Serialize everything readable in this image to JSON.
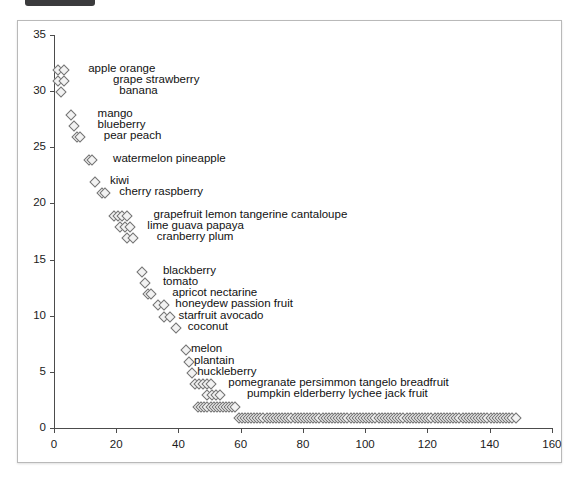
{
  "window": {
    "tab_fragment": ""
  },
  "chart_data": {
    "type": "scatter",
    "title": "",
    "subtitle": "",
    "xlabel": "",
    "ylabel": "",
    "xlim": [
      -4,
      168
    ],
    "ylim": [
      -0.8,
      36.2
    ],
    "grid": false,
    "legend": null,
    "xticks": [
      0,
      20,
      40,
      60,
      80,
      100,
      120,
      140,
      160
    ],
    "yticks": [
      0,
      5,
      10,
      15,
      20,
      25,
      30,
      35
    ],
    "xtick_labels": [
      "0",
      "20",
      "40",
      "60",
      "80",
      "100",
      "120",
      "140",
      "160"
    ],
    "ytick_labels": [
      "0",
      "5",
      "10",
      "15",
      "20",
      "25",
      "30",
      "35"
    ],
    "marker": "diamond",
    "marker_color": "#f2f2f2",
    "marker_edge_color": "#737373",
    "rows": [
      {
        "y": 32,
        "x_start": 1,
        "x_end": 3,
        "count": 2,
        "label": "apple  orange",
        "label_x": 11
      },
      {
        "y": 31,
        "x_start": 1,
        "x_end": 3,
        "count": 2,
        "label": "grape  strawberry",
        "label_x": 19
      },
      {
        "y": 30,
        "x_start": 2,
        "x_end": 2,
        "count": 1,
        "label": "banana",
        "label_x": 21
      },
      {
        "y": 28,
        "x_start": 5,
        "x_end": 5,
        "count": 1,
        "label": "mango",
        "label_x": 14
      },
      {
        "y": 27,
        "x_start": 6,
        "x_end": 6,
        "count": 1,
        "label": "blueberry",
        "label_x": 14
      },
      {
        "y": 26,
        "x_start": 7,
        "x_end": 8,
        "count": 2,
        "label": "pear  peach",
        "label_x": 16
      },
      {
        "y": 24,
        "x_start": 11,
        "x_end": 12,
        "count": 2,
        "label": "watermelon  pineapple",
        "label_x": 19
      },
      {
        "y": 22,
        "x_start": 13,
        "x_end": 13,
        "count": 1,
        "label": "kiwi",
        "label_x": 18
      },
      {
        "y": 21,
        "x_start": 15,
        "x_end": 16,
        "count": 2,
        "label": "cherry  raspberry",
        "label_x": 21
      },
      {
        "y": 19,
        "x_start": 19,
        "x_end": 23,
        "count": 4,
        "label": "grapefruit  lemon  tangerine  cantaloupe",
        "label_x": 32
      },
      {
        "y": 18,
        "x_start": 21,
        "x_end": 24,
        "count": 3,
        "label": "lime  guava  papaya",
        "label_x": 30
      },
      {
        "y": 17,
        "x_start": 23,
        "x_end": 25,
        "count": 2,
        "label": "cranberry  plum",
        "label_x": 33
      },
      {
        "y": 14,
        "x_start": 28,
        "x_end": 28,
        "count": 1,
        "label": "blackberry",
        "label_x": 35
      },
      {
        "y": 13,
        "x_start": 29,
        "x_end": 29,
        "count": 1,
        "label": "tomato",
        "label_x": 35
      },
      {
        "y": 12,
        "x_start": 30,
        "x_end": 31,
        "count": 2,
        "label": "apricot  nectarine",
        "label_x": 38
      },
      {
        "y": 11,
        "x_start": 33,
        "x_end": 35,
        "count": 2,
        "label": "honeydew  passion fruit",
        "label_x": 39
      },
      {
        "y": 10,
        "x_start": 35,
        "x_end": 37,
        "count": 2,
        "label": "starfruit  avocado",
        "label_x": 40
      },
      {
        "y": 9,
        "x_start": 39,
        "x_end": 39,
        "count": 1,
        "label": "coconut",
        "label_x": 43
      },
      {
        "y": 7,
        "x_start": 42,
        "x_end": 42,
        "count": 1,
        "label": "melon",
        "label_x": 44
      },
      {
        "y": 6,
        "x_start": 43,
        "x_end": 43,
        "count": 1,
        "label": "plantain",
        "label_x": 45
      },
      {
        "y": 5,
        "x_start": 44,
        "x_end": 44,
        "count": 1,
        "label": "huckleberry",
        "label_x": 46
      },
      {
        "y": 4,
        "x_start": 45,
        "x_end": 50,
        "count": 5,
        "label": "pomegranate  persimmon  tangelo  breadfruit",
        "label_x": 56
      },
      {
        "y": 3,
        "x_start": 49,
        "x_end": 53,
        "count": 4,
        "label": "pumpkin  elderberry  lychee  jack fruit",
        "label_x": 62
      },
      {
        "y": 2,
        "x_start": 46,
        "x_end": 58,
        "count": 13,
        "label": "",
        "label_x": 0
      },
      {
        "y": 1,
        "x_start": 59,
        "x_end": 148,
        "count": 90,
        "label": "",
        "label_x": 0
      }
    ]
  }
}
